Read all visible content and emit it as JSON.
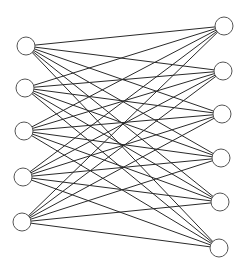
{
  "diagram": {
    "type": "complete-bipartite-graph",
    "node_radius": 9,
    "colors": {
      "edge": "#2a2a2a",
      "node_stroke": "#555555",
      "node_fill": "#ffffff",
      "background": "#ffffff"
    },
    "left_nodes": [
      {
        "x": 26,
        "y": 46
      },
      {
        "x": 25,
        "y": 88
      },
      {
        "x": 24,
        "y": 131
      },
      {
        "x": 23,
        "y": 177
      },
      {
        "x": 22,
        "y": 222
      }
    ],
    "right_nodes": [
      {
        "x": 224,
        "y": 26
      },
      {
        "x": 223,
        "y": 71
      },
      {
        "x": 222,
        "y": 114
      },
      {
        "x": 221,
        "y": 158
      },
      {
        "x": 220,
        "y": 202
      },
      {
        "x": 219,
        "y": 248
      }
    ],
    "edges": "all left-right pairs"
  }
}
